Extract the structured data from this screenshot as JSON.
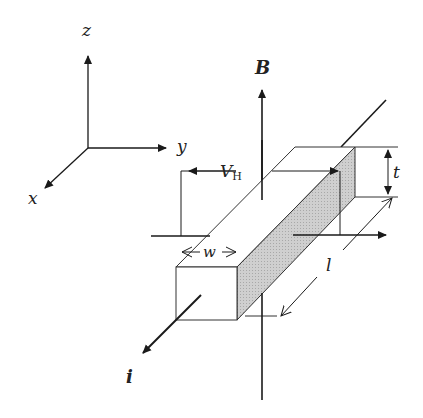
{
  "diagram": {
    "axes": {
      "z": "z",
      "y": "y",
      "x": "x"
    },
    "labels": {
      "magnetic_field": "B",
      "hall_voltage": "V",
      "hall_voltage_sub": "H",
      "thickness": "t",
      "width": "w",
      "length": "l",
      "current": "i"
    },
    "colors": {
      "stroke": "#1a1a1a",
      "shaded_face": "#c8c8c8",
      "background": "#ffffff"
    }
  }
}
